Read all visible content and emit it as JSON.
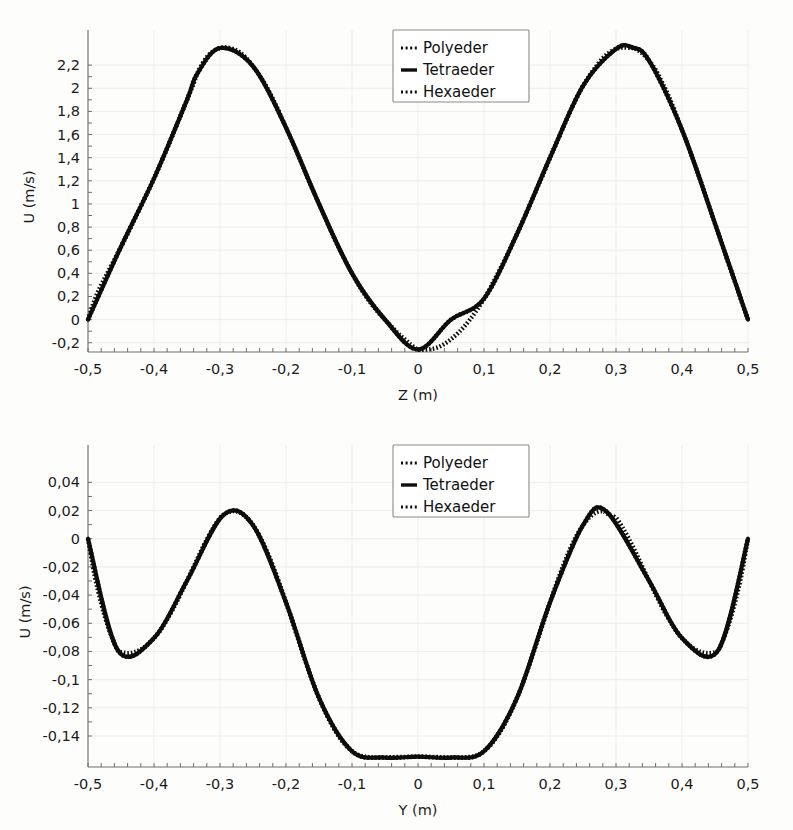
{
  "figure": {
    "background_color": "#fdfdfc",
    "curve_color": "#0d0d0d",
    "grid_color": "#e9e9e6",
    "axis_color": "#6f6f6f"
  },
  "legend": {
    "entries": [
      {
        "label": "Polyeder",
        "style": "dotted"
      },
      {
        "label": "Tetraeder",
        "style": "solid"
      },
      {
        "label": "Hexaeder",
        "style": "dotted"
      }
    ]
  },
  "chart_data": [
    {
      "type": "line",
      "id": "top",
      "title": "",
      "xlabel": "Z (m)",
      "ylabel": "U (m/s)",
      "xlim": [
        -0.5,
        0.5
      ],
      "ylim": [
        -0.28,
        2.4
      ],
      "grid": true,
      "legend_position": "top-center",
      "xticks": [
        -0.5,
        -0.4,
        -0.3,
        -0.2,
        -0.1,
        0,
        0.1,
        0.2,
        0.3,
        0.4,
        0.5
      ],
      "xticklabels": [
        "-0,5",
        "-0,4",
        "-0,3",
        "-0,2",
        "-0,1",
        "0",
        "0,1",
        "0,2",
        "0,3",
        "0,4",
        "0,5"
      ],
      "yticks": [
        -0.2,
        0,
        0.2,
        0.4,
        0.6,
        0.8,
        1,
        1.2,
        1.4,
        1.6,
        1.8,
        2,
        2.2
      ],
      "yticklabels": [
        "-0,2",
        "0",
        "0,2",
        "0,4",
        "0,6",
        "0,8",
        "1",
        "1,2",
        "1,4",
        "1,6",
        "1,8",
        "2",
        "2,2"
      ],
      "series": [
        {
          "name": "Polyeder",
          "style": "dotted",
          "x": [
            -0.5,
            -0.49,
            -0.48,
            -0.47,
            -0.46,
            -0.45,
            -0.44,
            -0.43,
            -0.42,
            -0.41,
            -0.4,
            -0.39,
            -0.38,
            -0.37,
            -0.36,
            -0.35,
            -0.34,
            -0.335,
            -0.33,
            -0.32,
            -0.31,
            -0.3,
            -0.29,
            -0.28,
            -0.27,
            -0.26,
            -0.25,
            -0.24,
            -0.23,
            -0.22,
            -0.21,
            -0.2,
            -0.19,
            -0.18,
            -0.17,
            -0.16,
            -0.15,
            -0.14,
            -0.13,
            -0.12,
            -0.11,
            -0.1,
            -0.09,
            -0.08,
            -0.07,
            -0.06,
            -0.05,
            -0.04,
            -0.03,
            -0.02,
            -0.01,
            0,
            0.01,
            0.02,
            0.03,
            0.04,
            0.05,
            0.06,
            0.07,
            0.08,
            0.09,
            0.1,
            0.11,
            0.12,
            0.13,
            0.14,
            0.15,
            0.16,
            0.17,
            0.18,
            0.19,
            0.2,
            0.21,
            0.22,
            0.23,
            0.24,
            0.25,
            0.26,
            0.27,
            0.28,
            0.29,
            0.3,
            0.31,
            0.32,
            0.325,
            0.33,
            0.34,
            0.35,
            0.36,
            0.37,
            0.38,
            0.39,
            0.4,
            0.41,
            0.42,
            0.43,
            0.44,
            0.45,
            0.46,
            0.47,
            0.48,
            0.49,
            0.5
          ],
          "y": [
            0.0,
            0.17,
            0.3,
            0.41,
            0.52,
            0.63,
            0.74,
            0.86,
            0.98,
            1.1,
            1.22,
            1.35,
            1.48,
            1.62,
            1.76,
            1.9,
            2.04,
            2.12,
            2.18,
            2.27,
            2.32,
            2.348,
            2.352,
            2.34,
            2.31,
            2.26,
            2.19,
            2.11,
            2.02,
            1.91,
            1.79,
            1.66,
            1.53,
            1.4,
            1.26,
            1.13,
            1.0,
            0.87,
            0.74,
            0.62,
            0.51,
            0.4,
            0.3,
            0.21,
            0.13,
            0.06,
            0.0,
            -0.06,
            -0.12,
            -0.17,
            -0.22,
            -0.258,
            -0.26,
            -0.255,
            -0.24,
            -0.21,
            -0.17,
            -0.12,
            -0.06,
            0.01,
            0.09,
            0.18,
            0.28,
            0.39,
            0.5,
            0.62,
            0.74,
            0.87,
            1.0,
            1.13,
            1.26,
            1.4,
            1.53,
            1.66,
            1.79,
            1.91,
            2.02,
            2.11,
            2.19,
            2.26,
            2.31,
            2.34,
            2.352,
            2.35,
            2.348,
            2.34,
            2.3,
            2.24,
            2.16,
            2.05,
            1.93,
            1.79,
            1.64,
            1.49,
            1.33,
            1.17,
            1.0,
            0.83,
            0.66,
            0.49,
            0.33,
            0.16,
            0.0
          ]
        },
        {
          "name": "Tetraeder",
          "style": "solid",
          "x": [
            -0.5,
            -0.45,
            -0.4,
            -0.35,
            -0.335,
            -0.3,
            -0.25,
            -0.2,
            -0.15,
            -0.1,
            -0.05,
            0,
            0.05,
            0.1,
            0.15,
            0.2,
            0.25,
            0.3,
            0.325,
            0.35,
            0.4,
            0.45,
            0.5
          ],
          "y": [
            0.0,
            0.63,
            1.22,
            1.9,
            2.12,
            2.348,
            2.19,
            1.66,
            1.0,
            0.4,
            0.0,
            -0.258,
            0.0,
            0.18,
            0.74,
            1.4,
            2.02,
            2.34,
            2.352,
            2.24,
            1.64,
            0.83,
            0.0
          ]
        },
        {
          "name": "Hexaeder",
          "style": "dotted",
          "x": [
            -0.5,
            -0.45,
            -0.4,
            -0.35,
            -0.335,
            -0.3,
            -0.25,
            -0.2,
            -0.15,
            -0.1,
            -0.05,
            0,
            0.05,
            0.1,
            0.15,
            0.2,
            0.25,
            0.3,
            0.325,
            0.35,
            0.4,
            0.45,
            0.5
          ],
          "y": [
            0.0,
            0.63,
            1.22,
            1.9,
            2.12,
            2.348,
            2.19,
            1.66,
            1.0,
            0.4,
            0.0,
            -0.258,
            0.0,
            0.18,
            0.74,
            1.4,
            2.02,
            2.34,
            2.352,
            2.24,
            1.64,
            0.83,
            0.0
          ]
        }
      ],
      "annotations": {
        "peak_left": {
          "x": -0.335,
          "y": 2.35
        },
        "peak_right": {
          "x": 0.325,
          "y": 2.35
        },
        "valley_center": {
          "x": 0.0,
          "y": -0.26
        }
      }
    },
    {
      "type": "line",
      "id": "bottom",
      "title": "",
      "xlabel": "Y (m)",
      "ylabel": "U (m/s)",
      "xlim": [
        -0.5,
        0.5
      ],
      "ylim": [
        -0.162,
        0.058
      ],
      "grid": true,
      "legend_position": "top-center",
      "xticks": [
        -0.5,
        -0.4,
        -0.3,
        -0.2,
        -0.1,
        0,
        0.1,
        0.2,
        0.3,
        0.4,
        0.5
      ],
      "xticklabels": [
        "-0,5",
        "-0,4",
        "-0,3",
        "-0,2",
        "-0,1",
        "0",
        "0,1",
        "0,2",
        "0,3",
        "0,4",
        "0,5"
      ],
      "yticks": [
        -0.14,
        -0.12,
        -0.1,
        -0.08,
        -0.06,
        -0.04,
        -0.02,
        0,
        0.02,
        0.04
      ],
      "yticklabels": [
        "-0,14",
        "-0,12",
        "-0,1",
        "-0,08",
        "-0,06",
        "-0,04",
        "-0,02",
        "0",
        "0,02",
        "0,04"
      ],
      "series": [
        {
          "name": "Polyeder",
          "style": "dotted",
          "x": [
            -0.5,
            -0.49,
            -0.48,
            -0.47,
            -0.46,
            -0.455,
            -0.45,
            -0.44,
            -0.43,
            -0.42,
            -0.41,
            -0.4,
            -0.39,
            -0.38,
            -0.37,
            -0.36,
            -0.35,
            -0.34,
            -0.33,
            -0.32,
            -0.31,
            -0.3,
            -0.295,
            -0.29,
            -0.28,
            -0.27,
            -0.26,
            -0.25,
            -0.24,
            -0.23,
            -0.22,
            -0.21,
            -0.2,
            -0.19,
            -0.18,
            -0.17,
            -0.16,
            -0.15,
            -0.14,
            -0.13,
            -0.12,
            -0.11,
            -0.1,
            -0.09,
            -0.08,
            -0.07,
            -0.06,
            -0.05,
            -0.04,
            -0.03,
            -0.02,
            -0.01,
            0,
            0.01,
            0.02,
            0.03,
            0.04,
            0.05,
            0.06,
            0.07,
            0.08,
            0.09,
            0.1,
            0.11,
            0.12,
            0.13,
            0.14,
            0.15,
            0.16,
            0.17,
            0.18,
            0.19,
            0.2,
            0.21,
            0.22,
            0.23,
            0.24,
            0.25,
            0.26,
            0.27,
            0.28,
            0.285,
            0.29,
            0.3,
            0.31,
            0.32,
            0.33,
            0.34,
            0.35,
            0.36,
            0.37,
            0.38,
            0.39,
            0.4,
            0.41,
            0.42,
            0.43,
            0.44,
            0.45,
            0.455,
            0.46,
            0.47,
            0.48,
            0.49,
            0.5
          ],
          "y": [
            0.0,
            -0.026,
            -0.046,
            -0.062,
            -0.074,
            -0.079,
            -0.0805,
            -0.0812,
            -0.0805,
            -0.0785,
            -0.0752,
            -0.0705,
            -0.0645,
            -0.0572,
            -0.0488,
            -0.0396,
            -0.0298,
            -0.0198,
            -0.0099,
            -0.0005,
            0.0079,
            0.0148,
            0.0168,
            0.0183,
            0.0196,
            0.0186,
            0.0152,
            0.0096,
            0.0019,
            -0.0077,
            -0.019,
            -0.0316,
            -0.0452,
            -0.0594,
            -0.0737,
            -0.0877,
            -0.101,
            -0.113,
            -0.1236,
            -0.1327,
            -0.1403,
            -0.1464,
            -0.1508,
            -0.1535,
            -0.1547,
            -0.1552,
            -0.1554,
            -0.1553,
            -0.1551,
            -0.1549,
            -0.1548,
            -0.1547,
            -0.1548,
            -0.1547,
            -0.1548,
            -0.1549,
            -0.1551,
            -0.1553,
            -0.1554,
            -0.1552,
            -0.1547,
            -0.1535,
            -0.1508,
            -0.1464,
            -0.1403,
            -0.1327,
            -0.1236,
            -0.113,
            -0.101,
            -0.0877,
            -0.0737,
            -0.0594,
            -0.0452,
            -0.0316,
            -0.019,
            -0.0077,
            0.0019,
            0.0096,
            0.0152,
            0.0186,
            0.0196,
            0.0183,
            0.0168,
            0.0148,
            0.0079,
            -0.0005,
            -0.0099,
            -0.0198,
            -0.0298,
            -0.0396,
            -0.0488,
            -0.0572,
            -0.0645,
            -0.0705,
            -0.0752,
            -0.0785,
            -0.0805,
            -0.0812,
            -0.0805,
            -0.079,
            -0.074,
            -0.062,
            -0.046,
            -0.026,
            0.0
          ]
        },
        {
          "name": "Tetraeder",
          "style": "solid",
          "x": [
            -0.5,
            -0.455,
            -0.4,
            -0.35,
            -0.295,
            -0.25,
            -0.2,
            -0.15,
            -0.1,
            -0.05,
            0,
            0.05,
            0.1,
            0.15,
            0.2,
            0.25,
            0.285,
            0.35,
            0.4,
            0.455,
            0.5
          ],
          "y": [
            0.0,
            -0.079,
            -0.0705,
            -0.0298,
            0.0168,
            0.0096,
            -0.0452,
            -0.113,
            -0.1508,
            -0.1553,
            -0.1547,
            -0.1553,
            -0.1508,
            -0.113,
            -0.0452,
            0.0096,
            0.0196,
            -0.0298,
            -0.0705,
            -0.079,
            0.0
          ]
        },
        {
          "name": "Hexaeder",
          "style": "dotted",
          "x": [
            -0.5,
            -0.455,
            -0.4,
            -0.35,
            -0.295,
            -0.25,
            -0.2,
            -0.15,
            -0.1,
            -0.05,
            0,
            0.05,
            0.1,
            0.15,
            0.2,
            0.25,
            0.285,
            0.35,
            0.4,
            0.455,
            0.5
          ],
          "y": [
            0.0,
            -0.079,
            -0.0705,
            -0.0298,
            0.0168,
            0.0096,
            -0.0452,
            -0.113,
            -0.1508,
            -0.1553,
            -0.1547,
            -0.1553,
            -0.1508,
            -0.113,
            -0.0452,
            0.0096,
            0.0196,
            -0.0298,
            -0.0705,
            -0.079,
            0.0
          ]
        }
      ],
      "annotations": {
        "dip_left": {
          "x": -0.455,
          "y": -0.081
        },
        "peak_left": {
          "x": -0.295,
          "y": 0.053
        },
        "valley_center": {
          "x": 0.0,
          "y": -0.155
        },
        "peak_right": {
          "x": 0.285,
          "y": 0.053
        },
        "dip_right": {
          "x": 0.455,
          "y": -0.081
        }
      }
    }
  ]
}
